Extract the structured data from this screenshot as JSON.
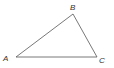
{
  "diagram": {
    "type": "triangle",
    "stroke_color": "#555555",
    "vertices": [
      {
        "label": "A",
        "x": 16,
        "y": 57
      },
      {
        "label": "B",
        "x": 73,
        "y": 14
      },
      {
        "label": "C",
        "x": 97,
        "y": 57
      }
    ],
    "labels": {
      "A": "A",
      "B": "B",
      "C": "C"
    }
  }
}
